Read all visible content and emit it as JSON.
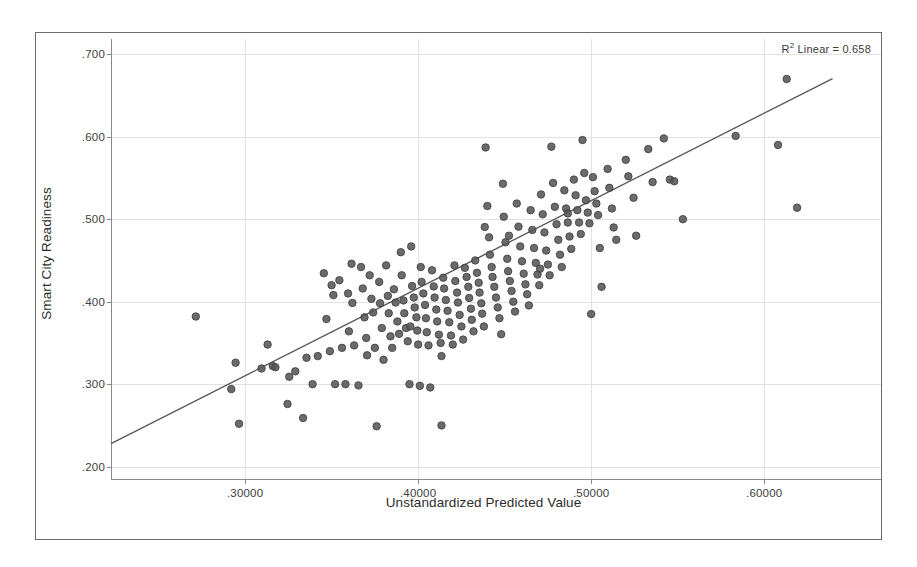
{
  "chart_data": {
    "type": "scatter",
    "title": "",
    "xlabel": "Unstandardized Predicted Value",
    "ylabel": "Smart City Readiness",
    "xlim": [
      0.2225,
      0.6675
    ],
    "ylim": [
      0.185,
      0.7185
    ],
    "xticks": [
      0.3,
      0.4,
      0.5,
      0.6
    ],
    "xticklabels": [
      ".30000",
      ".40000",
      ".50000",
      ".60000"
    ],
    "yticks": [
      0.2,
      0.3,
      0.4,
      0.5,
      0.6,
      0.7
    ],
    "yticklabels": [
      ".200",
      ".300",
      ".400",
      ".500",
      ".600",
      ".700"
    ],
    "grid": true,
    "legend": false,
    "annotation_label": "R",
    "annotation_sup": "2",
    "annotation_rest": " Linear = 0.658",
    "r_squared": 0.658,
    "fit_line": {
      "type": "linear",
      "x_start": 0.2225,
      "y_start": 0.228,
      "x_end": 0.6395,
      "y_end": 0.6705,
      "color": "#595959",
      "width": 1.4
    },
    "marker": {
      "shape": "circle",
      "diameter_px": 7.5,
      "fill": "#565656",
      "stroke": "#3c3c3c",
      "opacity": 0.88
    },
    "n_points": 205,
    "points": [
      [
        0.2715,
        0.382
      ],
      [
        0.292,
        0.294
      ],
      [
        0.2945,
        0.326
      ],
      [
        0.2965,
        0.252
      ],
      [
        0.3095,
        0.319
      ],
      [
        0.313,
        0.348
      ],
      [
        0.316,
        0.322
      ],
      [
        0.3175,
        0.3205
      ],
      [
        0.3245,
        0.276
      ],
      [
        0.3255,
        0.309
      ],
      [
        0.329,
        0.3155
      ],
      [
        0.3335,
        0.259
      ],
      [
        0.3355,
        0.332
      ],
      [
        0.339,
        0.3
      ],
      [
        0.342,
        0.334
      ],
      [
        0.3455,
        0.4345
      ],
      [
        0.347,
        0.379
      ],
      [
        0.349,
        0.34
      ],
      [
        0.35,
        0.42
      ],
      [
        0.351,
        0.408
      ],
      [
        0.352,
        0.3
      ],
      [
        0.3545,
        0.426
      ],
      [
        0.356,
        0.344
      ],
      [
        0.358,
        0.3
      ],
      [
        0.3595,
        0.41
      ],
      [
        0.36,
        0.364
      ],
      [
        0.3615,
        0.446
      ],
      [
        0.362,
        0.3985
      ],
      [
        0.363,
        0.347
      ],
      [
        0.3655,
        0.2985
      ],
      [
        0.367,
        0.442
      ],
      [
        0.368,
        0.416
      ],
      [
        0.369,
        0.381
      ],
      [
        0.37,
        0.356
      ],
      [
        0.3705,
        0.335
      ],
      [
        0.372,
        0.432
      ],
      [
        0.373,
        0.4035
      ],
      [
        0.374,
        0.387
      ],
      [
        0.375,
        0.344
      ],
      [
        0.376,
        0.249
      ],
      [
        0.3775,
        0.424
      ],
      [
        0.378,
        0.398
      ],
      [
        0.379,
        0.368
      ],
      [
        0.38,
        0.3295
      ],
      [
        0.3815,
        0.444
      ],
      [
        0.3825,
        0.407
      ],
      [
        0.383,
        0.386
      ],
      [
        0.384,
        0.358
      ],
      [
        0.385,
        0.344
      ],
      [
        0.386,
        0.415
      ],
      [
        0.387,
        0.399
      ],
      [
        0.388,
        0.376
      ],
      [
        0.389,
        0.361
      ],
      [
        0.39,
        0.46
      ],
      [
        0.3905,
        0.432
      ],
      [
        0.3915,
        0.4015
      ],
      [
        0.392,
        0.386
      ],
      [
        0.393,
        0.368
      ],
      [
        0.394,
        0.352
      ],
      [
        0.395,
        0.3
      ],
      [
        0.396,
        0.467
      ],
      [
        0.3965,
        0.419
      ],
      [
        0.3975,
        0.405
      ],
      [
        0.398,
        0.393
      ],
      [
        0.399,
        0.381
      ],
      [
        0.3995,
        0.365
      ],
      [
        0.4,
        0.348
      ],
      [
        0.401,
        0.298
      ],
      [
        0.4015,
        0.442
      ],
      [
        0.402,
        0.424
      ],
      [
        0.403,
        0.41
      ],
      [
        0.404,
        0.396
      ],
      [
        0.4045,
        0.38
      ],
      [
        0.405,
        0.363
      ],
      [
        0.406,
        0.347
      ],
      [
        0.407,
        0.296
      ],
      [
        0.408,
        0.438
      ],
      [
        0.409,
        0.4185
      ],
      [
        0.4095,
        0.405
      ],
      [
        0.4105,
        0.3905
      ],
      [
        0.411,
        0.376
      ],
      [
        0.412,
        0.36
      ],
      [
        0.413,
        0.35
      ],
      [
        0.4135,
        0.25
      ],
      [
        0.4145,
        0.429
      ],
      [
        0.415,
        0.416
      ],
      [
        0.416,
        0.402
      ],
      [
        0.417,
        0.389
      ],
      [
        0.418,
        0.375
      ],
      [
        0.419,
        0.359
      ],
      [
        0.42,
        0.348
      ],
      [
        0.421,
        0.444
      ],
      [
        0.4215,
        0.425
      ],
      [
        0.4225,
        0.411
      ],
      [
        0.423,
        0.399
      ],
      [
        0.424,
        0.384
      ],
      [
        0.425,
        0.37
      ],
      [
        0.426,
        0.354
      ],
      [
        0.427,
        0.441
      ],
      [
        0.428,
        0.43
      ],
      [
        0.429,
        0.418
      ],
      [
        0.4295,
        0.4045
      ],
      [
        0.4305,
        0.3915
      ],
      [
        0.431,
        0.378
      ],
      [
        0.432,
        0.364
      ],
      [
        0.433,
        0.45
      ],
      [
        0.434,
        0.435
      ],
      [
        0.435,
        0.423
      ],
      [
        0.4355,
        0.411
      ],
      [
        0.4365,
        0.398
      ],
      [
        0.437,
        0.3855
      ],
      [
        0.438,
        0.37
      ],
      [
        0.439,
        0.587
      ],
      [
        0.44,
        0.516
      ],
      [
        0.441,
        0.478
      ],
      [
        0.4415,
        0.457
      ],
      [
        0.4425,
        0.442
      ],
      [
        0.443,
        0.43
      ],
      [
        0.444,
        0.418
      ],
      [
        0.445,
        0.405
      ],
      [
        0.446,
        0.393
      ],
      [
        0.447,
        0.38
      ],
      [
        0.448,
        0.3605
      ],
      [
        0.449,
        0.543
      ],
      [
        0.4495,
        0.503
      ],
      [
        0.4505,
        0.472
      ],
      [
        0.4515,
        0.452
      ],
      [
        0.452,
        0.437
      ],
      [
        0.453,
        0.425
      ],
      [
        0.454,
        0.413
      ],
      [
        0.455,
        0.4
      ],
      [
        0.456,
        0.388
      ],
      [
        0.457,
        0.519
      ],
      [
        0.458,
        0.491
      ],
      [
        0.459,
        0.467
      ],
      [
        0.46,
        0.449
      ],
      [
        0.461,
        0.434
      ],
      [
        0.462,
        0.421
      ],
      [
        0.463,
        0.409
      ],
      [
        0.464,
        0.3955
      ],
      [
        0.465,
        0.511
      ],
      [
        0.466,
        0.487
      ],
      [
        0.467,
        0.465
      ],
      [
        0.468,
        0.447
      ],
      [
        0.469,
        0.433
      ],
      [
        0.47,
        0.42
      ],
      [
        0.471,
        0.53
      ],
      [
        0.472,
        0.506
      ],
      [
        0.473,
        0.484
      ],
      [
        0.474,
        0.462
      ],
      [
        0.475,
        0.445
      ],
      [
        0.476,
        0.432
      ],
      [
        0.477,
        0.588
      ],
      [
        0.478,
        0.544
      ],
      [
        0.479,
        0.515
      ],
      [
        0.48,
        0.494
      ],
      [
        0.481,
        0.475
      ],
      [
        0.482,
        0.457
      ],
      [
        0.483,
        0.442
      ],
      [
        0.4845,
        0.535
      ],
      [
        0.4855,
        0.513
      ],
      [
        0.4865,
        0.496
      ],
      [
        0.4875,
        0.479
      ],
      [
        0.4885,
        0.464
      ],
      [
        0.49,
        0.548
      ],
      [
        0.491,
        0.529
      ],
      [
        0.492,
        0.511
      ],
      [
        0.493,
        0.496
      ],
      [
        0.494,
        0.482
      ],
      [
        0.495,
        0.596
      ],
      [
        0.496,
        0.556
      ],
      [
        0.497,
        0.523
      ],
      [
        0.498,
        0.508
      ],
      [
        0.499,
        0.495
      ],
      [
        0.5,
        0.385
      ],
      [
        0.501,
        0.551
      ],
      [
        0.502,
        0.534
      ],
      [
        0.503,
        0.519
      ],
      [
        0.504,
        0.505
      ],
      [
        0.505,
        0.465
      ],
      [
        0.506,
        0.418
      ],
      [
        0.5095,
        0.561
      ],
      [
        0.5105,
        0.538
      ],
      [
        0.512,
        0.513
      ],
      [
        0.513,
        0.49
      ],
      [
        0.5145,
        0.475
      ],
      [
        0.52,
        0.572
      ],
      [
        0.5215,
        0.552
      ],
      [
        0.5245,
        0.526
      ],
      [
        0.526,
        0.48
      ],
      [
        0.533,
        0.585
      ],
      [
        0.5355,
        0.545
      ],
      [
        0.542,
        0.598
      ],
      [
        0.5455,
        0.548
      ],
      [
        0.548,
        0.546
      ],
      [
        0.553,
        0.5
      ],
      [
        0.5835,
        0.601
      ],
      [
        0.608,
        0.59
      ],
      [
        0.613,
        0.67
      ],
      [
        0.619,
        0.514
      ],
      [
        0.4385,
        0.4905
      ],
      [
        0.4525,
        0.48
      ],
      [
        0.4705,
        0.44
      ],
      [
        0.4865,
        0.507
      ],
      [
        0.4135,
        0.334
      ],
      [
        0.3955,
        0.37
      ]
    ]
  }
}
